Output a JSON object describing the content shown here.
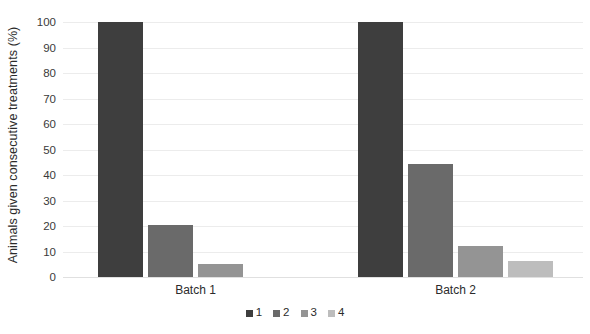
{
  "chart_data": {
    "type": "bar",
    "title": "",
    "xlabel": "",
    "ylabel": "Animals given consecutive treatments (%)",
    "categories": [
      "Batch 1",
      "Batch 2"
    ],
    "series": [
      {
        "name": "1",
        "color": "#3e3e3e",
        "values": [
          100,
          100
        ]
      },
      {
        "name": "2",
        "color": "#6a6a6a",
        "values": [
          20.4,
          44.5
        ]
      },
      {
        "name": "3",
        "color": "#949494",
        "values": [
          5.1,
          12.2
        ]
      },
      {
        "name": "4",
        "color": "#bdbdbd",
        "values": [
          0,
          6.3
        ]
      }
    ],
    "ylim": [
      0,
      100
    ],
    "yticks": [
      100,
      90,
      80,
      70,
      60,
      50,
      40,
      30,
      20,
      10,
      0
    ],
    "ytick_labels": [
      "100",
      "90",
      "80",
      "70",
      "60",
      "50",
      "40",
      "30",
      "20",
      "10",
      "0"
    ],
    "grid": true,
    "legend_position": "bottom",
    "legend_entries": [
      "1",
      "2",
      "3",
      "4"
    ],
    "gridline_color": "#ececec",
    "background_color": "#ffffff"
  }
}
